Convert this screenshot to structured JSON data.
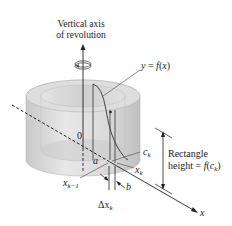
{
  "title": {
    "line1": "Vertical axis",
    "line2": "of revolution"
  },
  "labels": {
    "curve": "y = f(x)",
    "origin": "0",
    "a": "a",
    "b": "b",
    "ck": "c",
    "ck_sub": "k",
    "xk": "x",
    "xk_sub": "k",
    "xk1": "x",
    "xk1_sub": "k−1",
    "dx": "Δx",
    "dx_sub": "k",
    "x_axis": "x",
    "rect_line1": "Rectangle",
    "rect_line2_prefix": "height = f(c",
    "rect_line2_sub": "k",
    "rect_line2_suffix": ")"
  },
  "colors": {
    "shell_light": "#e6e6e6",
    "shell_mid": "#d2d2d2",
    "shell_dark": "#bdbdbd",
    "ink": "#222222"
  }
}
